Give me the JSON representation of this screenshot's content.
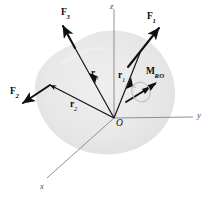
{
  "figure": {
    "background_color": "#ffffff",
    "body_color": "#e6e6e6",
    "vector_color": "#101010",
    "axis_color": "#8f8f8f"
  },
  "axes": [
    {
      "name": "z-axis",
      "label": "z",
      "label_x": 110,
      "label_y": 3,
      "from": [
        114,
        118
      ],
      "to": [
        114,
        9
      ]
    },
    {
      "name": "y-axis",
      "label": "y",
      "label_x": 198,
      "label_y": 112,
      "from": [
        114,
        118
      ],
      "to": [
        193,
        117
      ]
    },
    {
      "name": "x-axis",
      "label": "x",
      "label_x": 40,
      "label_y": 183,
      "from": [
        114,
        118
      ],
      "to": [
        47,
        178
      ]
    }
  ],
  "origin": {
    "label": "O",
    "label_x": 116,
    "label_y": 120,
    "point": [
      114,
      118
    ]
  },
  "forces": [
    {
      "name": "force-1",
      "label": "F",
      "subscript": "1",
      "label_x": 148,
      "label_y": 13,
      "from": [
        128,
        67
      ],
      "to": [
        160,
        27
      ]
    },
    {
      "name": "force-2",
      "label": "F",
      "subscript": "2",
      "label_x": 10,
      "label_y": 88,
      "from": [
        50,
        85
      ],
      "to": [
        22,
        104
      ]
    },
    {
      "name": "force-3",
      "label": "F",
      "subscript": "3",
      "label_x": 62,
      "label_y": 9,
      "from": [
        75,
        48
      ],
      "to": [
        62,
        25
      ]
    }
  ],
  "position_vectors": [
    {
      "name": "position-vector-1",
      "label": "r",
      "subscript": "1",
      "label_x": 118,
      "label_y": 72,
      "from": [
        114,
        118
      ],
      "to": [
        140,
        53
      ]
    },
    {
      "name": "position-vector-2",
      "label": "r",
      "subscript": "2",
      "label_x": 71,
      "label_y": 101,
      "from": [
        114,
        118
      ],
      "to": [
        50,
        85
      ]
    },
    {
      "name": "position-vector-3",
      "label": "r",
      "subscript": "3",
      "label_x": 92,
      "label_y": 70,
      "from": [
        114,
        118
      ],
      "to": [
        75,
        48
      ]
    }
  ],
  "moment": {
    "name": "resultant-moment",
    "label": "M",
    "subscript": "R",
    "subscript2": "O",
    "label_x": 147,
    "label_y": 68,
    "from": [
      126,
      102
    ],
    "to": [
      158,
      82
    ],
    "loop_center": [
      141,
      92
    ],
    "loop_radius": 9
  }
}
